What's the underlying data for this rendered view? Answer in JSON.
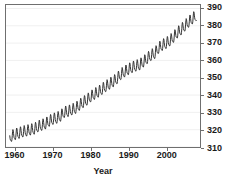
{
  "chart_data": {
    "type": "line",
    "title": "",
    "subtitle": "",
    "xlabel": "Year",
    "ylabel": "",
    "xlim": [
      1957.5,
      2009.0
    ],
    "ylim": [
      310,
      392
    ],
    "xticks": [
      1960,
      1970,
      1980,
      1990,
      2000
    ],
    "xtick_labels": [
      "1960",
      "1970",
      "1980",
      "1990",
      "2000"
    ],
    "yticks": [
      310,
      320,
      330,
      340,
      350,
      360,
      370,
      380,
      390
    ],
    "ytick_labels": [
      "310",
      "320",
      "330",
      "340",
      "350",
      "360",
      "370",
      "380",
      "390"
    ],
    "y_axis_position": "right",
    "grid": true,
    "grid_color": "#f0f0f0",
    "grid_axis": "y",
    "legend": null,
    "series": [
      {
        "name": "Atmospheric CO2 (ppm)",
        "color": "#333333",
        "line_width": 1,
        "description": "Monthly mean CO2 with annual seasonal sawtooth oscillation of about +/- 3 ppm superimposed on a rising trend",
        "seasonal_amplitude": 3.0,
        "x": [
          1958.5,
          1959,
          1960,
          1961,
          1962,
          1963,
          1964,
          1965,
          1966,
          1967,
          1968,
          1969,
          1970,
          1971,
          1972,
          1973,
          1974,
          1975,
          1976,
          1977,
          1978,
          1979,
          1980,
          1981,
          1982,
          1983,
          1984,
          1985,
          1986,
          1987,
          1988,
          1989,
          1990,
          1991,
          1992,
          1993,
          1994,
          1995,
          1996,
          1997,
          1998,
          1999,
          2000,
          2001,
          2002,
          2003,
          2004,
          2005,
          2006,
          2007,
          2008
        ],
        "values": [
          315.0,
          315.9,
          316.9,
          317.6,
          318.4,
          318.9,
          319.5,
          320.0,
          321.4,
          322.2,
          323.0,
          324.6,
          325.7,
          326.3,
          327.5,
          329.7,
          330.2,
          331.1,
          332.0,
          333.8,
          335.4,
          336.8,
          338.7,
          340.1,
          341.4,
          343.0,
          344.6,
          346.0,
          347.4,
          349.2,
          351.6,
          353.1,
          354.4,
          355.6,
          356.4,
          357.1,
          358.8,
          360.8,
          362.6,
          363.7,
          366.7,
          368.4,
          369.5,
          371.0,
          373.1,
          375.6,
          377.4,
          379.6,
          381.8,
          383.7,
          385.6
        ]
      }
    ]
  }
}
